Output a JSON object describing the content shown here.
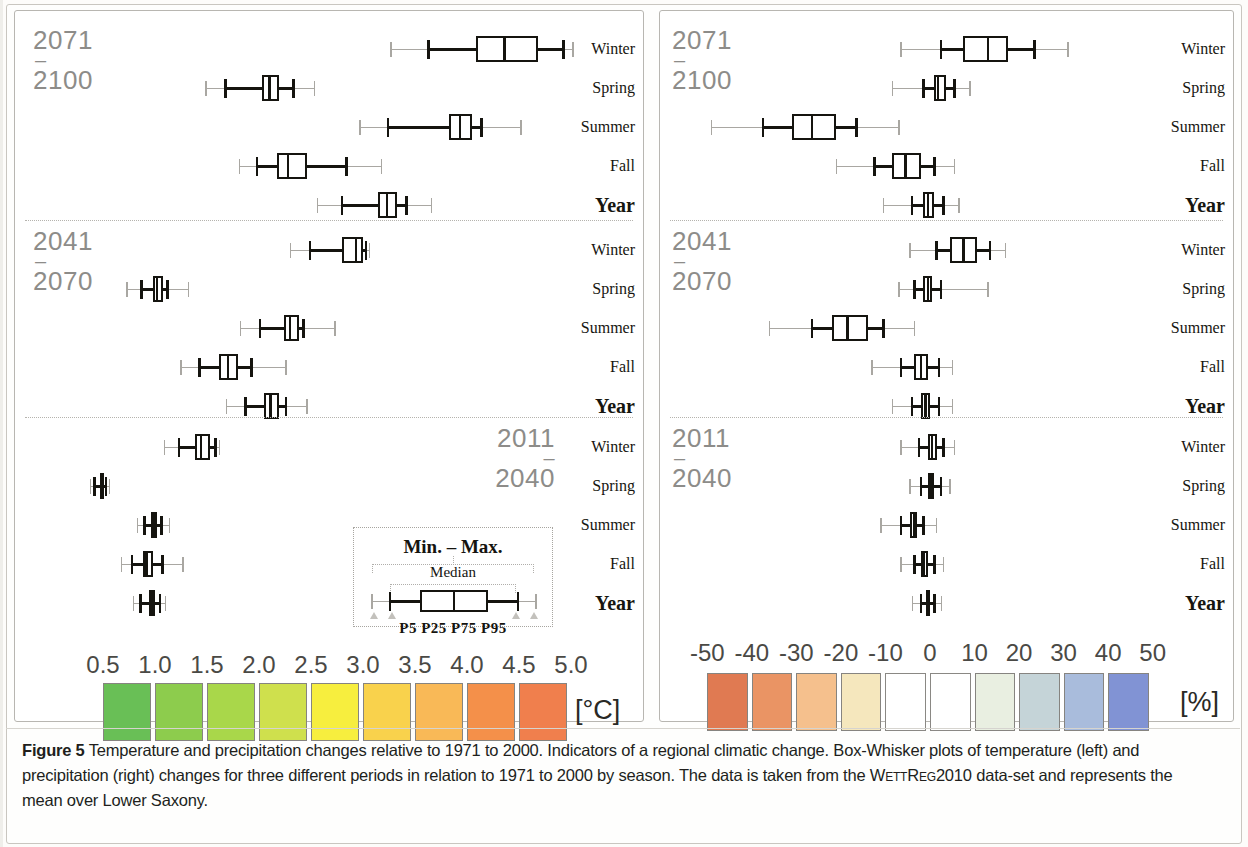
{
  "figure": {
    "label": "Figure 5",
    "caption": "Temperature and precipitation changes relative to 1971 to 2000. Indicators of a regional climatic change. Box-Whisker plots of temperature (left) and precipitation (right) changes for three different periods in relation to 1971 to 2000 by season. The data is taken from the WETTREG2010 data-set and represents the mean over Lower Saxony.",
    "caption_part1": "Temperature and precipitation changes relative to 1971 to 2000. Indicators of a regional climatic change. Box-Whisker plots of temperature (left) and precipitation (right) changes for three different periods in relation to 1971 to 2000 by season. The data is taken from the ",
    "caption_smallcaps": "WettReg2010",
    "caption_part2": " data-set and represents the mean over Lower Saxony."
  },
  "legend": {
    "minmax_label": "Min. – Max.",
    "median_label": "Median",
    "percentile_label": "P5 P25  P75 P95",
    "p5": "P5",
    "p25": "P25",
    "p75": "P75",
    "p95": "P95"
  },
  "periods": [
    {
      "start": "2071",
      "dash": "–",
      "end": "2100"
    },
    {
      "start": "2041",
      "dash": "–",
      "end": "2070"
    },
    {
      "start": "2011",
      "dash": "–",
      "end": "2040"
    }
  ],
  "seasons": [
    "Winter",
    "Spring",
    "Summer",
    "Fall",
    "Year"
  ],
  "chart_data": [
    {
      "type": "box",
      "title": "Temperature change",
      "xlabel": "[°C]",
      "unit": "[°C]",
      "xlim": [
        0.25,
        5.25
      ],
      "ticks": [
        0.5,
        1.0,
        1.5,
        2.0,
        2.5,
        3.0,
        3.5,
        4.0,
        4.5,
        5.0
      ],
      "tick_labels": [
        "0.5",
        "1.0",
        "1.5",
        "2.0",
        "2.5",
        "3.0",
        "3.5",
        "4.0",
        "4.5",
        "5.0"
      ],
      "colorbar": [
        "#69bf56",
        "#8dcc4d",
        "#a9d74a",
        "#cfe04d",
        "#f7ee3e",
        "#f9d24c",
        "#f9b957",
        "#f4904a",
        "#f07f4d"
      ],
      "grid": false,
      "groups": [
        {
          "period": "2071–2100",
          "boxes": [
            {
              "season": "Winter",
              "min": 3.27,
              "p5": 3.63,
              "p25": 4.09,
              "median": 4.36,
              "p75": 4.68,
              "p95": 4.93,
              "max": 5.02
            },
            {
              "season": "Spring",
              "min": 1.49,
              "p5": 1.68,
              "p25": 2.03,
              "median": 2.1,
              "p75": 2.19,
              "p95": 2.33,
              "max": 2.53
            },
            {
              "season": "Summer",
              "min": 2.97,
              "p5": 3.24,
              "p25": 3.83,
              "median": 3.93,
              "p75": 4.05,
              "p95": 4.14,
              "max": 4.52
            },
            {
              "season": "Fall",
              "min": 1.81,
              "p5": 1.98,
              "p25": 2.17,
              "median": 2.28,
              "p75": 2.46,
              "p95": 2.84,
              "max": 3.18
            },
            {
              "season": "Year",
              "min": 2.56,
              "p5": 2.8,
              "p25": 3.14,
              "median": 3.23,
              "p75": 3.33,
              "p95": 3.42,
              "max": 3.66
            }
          ]
        },
        {
          "period": "2041–2070",
          "boxes": [
            {
              "season": "Winter",
              "min": 2.3,
              "p5": 2.49,
              "p25": 2.8,
              "median": 2.93,
              "p75": 3.0,
              "p95": 3.03,
              "max": 3.06
            },
            {
              "season": "Spring",
              "min": 0.73,
              "p5": 0.87,
              "p25": 0.98,
              "median": 1.02,
              "p75": 1.08,
              "p95": 1.12,
              "max": 1.32
            },
            {
              "season": "Summer",
              "min": 1.82,
              "p5": 2.01,
              "p25": 2.24,
              "median": 2.3,
              "p75": 2.38,
              "p95": 2.43,
              "max": 2.73
            },
            {
              "season": "Fall",
              "min": 1.25,
              "p5": 1.43,
              "p25": 1.62,
              "median": 1.7,
              "p75": 1.8,
              "p95": 1.93,
              "max": 2.26
            },
            {
              "season": "Year",
              "min": 1.69,
              "p5": 1.87,
              "p25": 2.05,
              "median": 2.11,
              "p75": 2.19,
              "p95": 2.26,
              "max": 2.46
            }
          ]
        },
        {
          "period": "2011–2040",
          "boxes": [
            {
              "season": "Winter",
              "min": 1.09,
              "p5": 1.23,
              "p25": 1.38,
              "median": 1.44,
              "p75": 1.53,
              "p95": 1.58,
              "max": 1.62
            },
            {
              "season": "Spring",
              "min": 0.38,
              "p5": 0.42,
              "p25": 0.47,
              "median": 0.49,
              "p75": 0.51,
              "p95": 0.53,
              "max": 0.56
            },
            {
              "season": "Summer",
              "min": 0.83,
              "p5": 0.9,
              "p25": 0.96,
              "median": 0.99,
              "p75": 1.02,
              "p95": 1.06,
              "max": 1.14
            },
            {
              "season": "Fall",
              "min": 0.68,
              "p5": 0.78,
              "p25": 0.88,
              "median": 0.92,
              "p75": 0.98,
              "p95": 1.07,
              "max": 1.27
            },
            {
              "season": "Year",
              "min": 0.79,
              "p5": 0.86,
              "p25": 0.94,
              "median": 0.97,
              "p75": 1.0,
              "p95": 1.05,
              "max": 1.1
            }
          ]
        }
      ]
    },
    {
      "type": "box",
      "title": "Precipitation change",
      "xlabel": "[%]",
      "unit": "[%]",
      "xlim": [
        -55,
        55
      ],
      "ticks": [
        -50,
        -40,
        -30,
        -20,
        -10,
        0,
        10,
        20,
        30,
        40,
        50
      ],
      "tick_labels": [
        "-50",
        "-40",
        "-30",
        "-20",
        "-10",
        "0",
        "10",
        "20",
        "30",
        "40",
        "50"
      ],
      "colorbar": [
        "#e07a52",
        "#ea9464",
        "#f5c08d",
        "#f5e7bd",
        "#ffffff",
        "#ffffff",
        "#e9efe1",
        "#c5d4d8",
        "#a9bcdc",
        "#8193d4"
      ],
      "grid": false,
      "groups": [
        {
          "period": "2071–2100",
          "boxes": [
            {
              "season": "Winter",
              "min": -6.5,
              "p5": 2.5,
              "p25": 7.5,
              "median": 13.0,
              "p75": 17.5,
              "p95": 23.5,
              "max": 31.0
            },
            {
              "season": "Spring",
              "min": -8.5,
              "p5": -1.5,
              "p25": 1.0,
              "median": 1.8,
              "p75": 3.5,
              "p95": 5.5,
              "max": 9.0
            },
            {
              "season": "Summer",
              "min": -49.0,
              "p5": -37.5,
              "p25": -31.0,
              "median": -26.5,
              "p75": -21.0,
              "p95": -16.5,
              "max": -7.0
            },
            {
              "season": "Fall",
              "min": -21.0,
              "p5": -12.5,
              "p25": -8.5,
              "median": -5.5,
              "p75": -2.0,
              "p95": 1.0,
              "max": 5.5
            },
            {
              "season": "Year",
              "min": -10.5,
              "p5": -4.0,
              "p25": -1.5,
              "median": -0.5,
              "p75": 1.0,
              "p95": 3.0,
              "max": 6.5
            }
          ]
        },
        {
          "period": "2041–2070",
          "boxes": [
            {
              "season": "Winter",
              "min": -4.5,
              "p5": 1.5,
              "p25": 4.5,
              "median": 7.5,
              "p75": 10.5,
              "p95": 13.5,
              "max": 17.0
            },
            {
              "season": "Spring",
              "min": -7.0,
              "p5": -3.5,
              "p25": -1.5,
              "median": -0.5,
              "p75": 0.5,
              "p95": 2.5,
              "max": 13.0
            },
            {
              "season": "Summer",
              "min": -36.0,
              "p5": -26.5,
              "p25": -22.0,
              "median": -18.5,
              "p75": -14.0,
              "p95": -10.5,
              "max": -3.5
            },
            {
              "season": "Fall",
              "min": -13.0,
              "p5": -6.5,
              "p25": -3.5,
              "median": -2.0,
              "p75": -0.5,
              "p95": 2.0,
              "max": 5.0
            },
            {
              "season": "Year",
              "min": -8.5,
              "p5": -4.0,
              "p25": -2.0,
              "median": -1.0,
              "p75": 0.0,
              "p95": 2.0,
              "max": 5.0
            }
          ]
        },
        {
          "period": "2011–2040",
          "boxes": [
            {
              "season": "Winter",
              "min": -6.5,
              "p5": -2.5,
              "p25": -0.5,
              "median": 0.5,
              "p75": 1.5,
              "p95": 3.0,
              "max": 5.5
            },
            {
              "season": "Spring",
              "min": -4.5,
              "p5": -2.0,
              "p25": -0.5,
              "median": 0.3,
              "p75": 1.0,
              "p95": 2.5,
              "max": 4.5
            },
            {
              "season": "Summer",
              "min": -11.0,
              "p5": -6.5,
              "p25": -4.5,
              "median": -3.5,
              "p75": -3.0,
              "p95": -1.5,
              "max": 1.5
            },
            {
              "season": "Fall",
              "min": -6.5,
              "p5": -3.5,
              "p25": -2.0,
              "median": -1.5,
              "p75": -0.5,
              "p95": 1.0,
              "max": 3.0
            },
            {
              "season": "Year",
              "min": -4.0,
              "p5": -2.0,
              "p25": -1.0,
              "median": -0.5,
              "p75": 0.0,
              "p95": 1.0,
              "max": 2.5
            }
          ]
        }
      ]
    }
  ]
}
